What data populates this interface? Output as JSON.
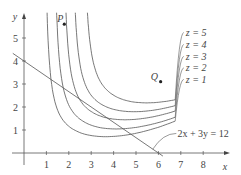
{
  "chart_data": {
    "type": "line",
    "title": "",
    "xlabel": "x",
    "ylabel": "y",
    "xlim": [
      0,
      9
    ],
    "ylim": [
      0,
      6
    ],
    "x_ticks": [
      "1",
      "2",
      "3",
      "4",
      "5",
      "6",
      "7",
      "8"
    ],
    "y_ticks": [
      "1",
      "2",
      "3",
      "4",
      "5"
    ],
    "grid": false,
    "level_curves": [
      {
        "label": "z = 1",
        "level": 1
      },
      {
        "label": "z = 2",
        "level": 2
      },
      {
        "label": "z = 3",
        "level": 3
      },
      {
        "label": "z = 4",
        "level": 4
      },
      {
        "label": "z = 5",
        "level": 5
      }
    ],
    "constraint": {
      "label": "2x + 3y = 12",
      "a": 2,
      "b": 3,
      "c": 12
    },
    "points": [
      {
        "label": "P",
        "x": 1.8,
        "y": 5.6
      },
      {
        "label": "Q",
        "x": 6.1,
        "y": 3.1
      }
    ]
  }
}
